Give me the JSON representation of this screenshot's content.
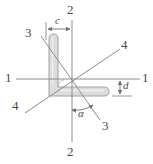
{
  "figure": {
    "type": "engineering-cross-section-diagram",
    "colors": {
      "line": "#8c8c8c",
      "shape_fill": "#d9d9d9",
      "shape_stroke": "#9a9a9a",
      "text": "#4a4a4a",
      "background": "#ffffff"
    },
    "centroid": {
      "x": 72,
      "y": 79
    }
  },
  "axes": [
    {
      "id": "axis-1-1",
      "name": "1-1",
      "orientation": "horizontal",
      "label_left": "1",
      "label_right": "1",
      "label_left_pos": {
        "x": 6,
        "y": 72
      },
      "label_right_pos": {
        "x": 142,
        "y": 72
      },
      "x1": 16,
      "y1": 79,
      "x2": 140,
      "y2": 79
    },
    {
      "id": "axis-2-2",
      "name": "2-2",
      "orientation": "vertical",
      "label_top": "2",
      "label_bottom": "2",
      "label_top_pos": {
        "x": 68,
        "y": 4
      },
      "label_bottom_pos": {
        "x": 68,
        "y": 146
      },
      "x1": 72,
      "y1": 20,
      "x2": 72,
      "y2": 142
    },
    {
      "id": "axis-3-3",
      "name": "3-3",
      "orientation": "diagonal-descending",
      "label_start": "3",
      "label_end": "3",
      "label_start_pos": {
        "x": 26,
        "y": 28
      },
      "label_end_pos": {
        "x": 104,
        "y": 122
      },
      "x1": 41,
      "y1": 36,
      "x2": 100,
      "y2": 120
    },
    {
      "id": "axis-4-4",
      "name": "4-4",
      "orientation": "diagonal-ascending",
      "label_start": "4",
      "label_end": "4",
      "label_start_pos": {
        "x": 13,
        "y": 101
      },
      "label_end_pos": {
        "x": 122,
        "y": 40
      },
      "x1": 25,
      "y1": 113,
      "x2": 120,
      "y2": 49
    }
  ],
  "dimensions": [
    {
      "id": "dimension-c",
      "label": "c",
      "orientation": "horizontal",
      "label_pos": {
        "x": 54,
        "y": 17
      },
      "line_y": 29,
      "x_start": 46,
      "x_end": 72,
      "extension_top": 22,
      "extension_bottom": 40
    },
    {
      "id": "dimension-d",
      "label": "d",
      "orientation": "vertical",
      "label_pos": {
        "x": 124,
        "y": 82
      },
      "line_x": 120,
      "y_start": 79,
      "y_end": 96,
      "extension_left": 112,
      "extension_right": 130
    }
  ],
  "angle": {
    "id": "angle-alpha",
    "label": "α",
    "label_pos": {
      "x": 79,
      "y": 110
    },
    "arc_center": {
      "x": 72,
      "y": 79
    },
    "arc_radius": 30,
    "from_axis": "2-2",
    "to_axis": "3-3"
  },
  "shape": {
    "id": "angle-section",
    "name": "L-shaped angle profile",
    "vertical_leg": {
      "left": 46,
      "right": 58,
      "top": 33,
      "bottom": 96
    },
    "horizontal_leg": {
      "left": 46,
      "right": 110,
      "top": 85,
      "bottom": 96
    }
  }
}
